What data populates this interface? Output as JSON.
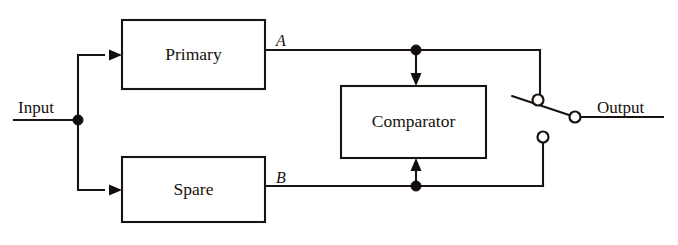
{
  "diagram": {
    "background_color": "#ffffff",
    "line_color": "#1a1410",
    "blocks": [
      {
        "id": "primary",
        "label": "Primary",
        "x": 122,
        "y": 20,
        "width": 143,
        "height": 69,
        "cx": 193.5,
        "cy": 54.5
      },
      {
        "id": "comparator",
        "label": "Comparator",
        "x": 341,
        "y": 86,
        "width": 145,
        "height": 72,
        "cx": 413.5,
        "cy": 122
      },
      {
        "id": "spare",
        "label": "Spare",
        "x": 122,
        "y": 157,
        "width": 143,
        "height": 65,
        "cx": 193.5,
        "cy": 189.5
      }
    ],
    "port_labels": [
      {
        "id": "port-a",
        "text": "A",
        "x": 281,
        "y": 46
      },
      {
        "id": "port-b",
        "text": "B",
        "x": 281,
        "y": 183
      }
    ],
    "io_labels": [
      {
        "id": "input",
        "text": "Input",
        "x": 18,
        "y": 113
      },
      {
        "id": "output",
        "text": "Output",
        "x": 597,
        "y": 113
      }
    ],
    "junctions": [
      {
        "id": "input-junction",
        "x": 78,
        "y": 120,
        "r": 5
      },
      {
        "id": "primary-output-junction",
        "x": 416,
        "y": 50,
        "r": 5
      },
      {
        "id": "spare-output-junction",
        "x": 416,
        "y": 186,
        "r": 5
      }
    ],
    "terminals": [
      {
        "id": "switch-pivot-terminal",
        "x": 538,
        "y": 100,
        "r": 5.5
      },
      {
        "id": "switch-output-contact",
        "x": 575,
        "y": 117,
        "r": 5.5
      },
      {
        "id": "switch-spare-contact",
        "x": 543,
        "y": 137,
        "r": 5.5
      }
    ],
    "switch": {
      "id": "transfer-switch",
      "state": "connected-to-primary",
      "blade_start_x": 512,
      "blade_start_y": 96,
      "blade_end_x": 575,
      "blade_end_y": 117
    },
    "wires": [
      {
        "id": "input-lead",
        "path": "M 14 120 L 78 120"
      },
      {
        "id": "input-to-primary-branch",
        "path": "M 78 120 L 78 55 L 104 55"
      },
      {
        "id": "input-to-spare-branch",
        "path": "M 78 120 L 78 190 L 104 190"
      },
      {
        "id": "primary-output-line",
        "path": "M 265 50 L 540 50"
      },
      {
        "id": "spare-output-line",
        "path": "M 265 186 L 543 186"
      },
      {
        "id": "primary-feedback-drop",
        "path": "M 540 50 L 540 96"
      },
      {
        "id": "spare-feedback-rise",
        "path": "M 543 186 L 543 143"
      },
      {
        "id": "comparator-top-lead",
        "path": "M 416 50 L 416 80"
      },
      {
        "id": "comparator-bottom-lead",
        "path": "M 416 186 L 416 163"
      },
      {
        "id": "output-lead",
        "path": "M 581 117 L 663 117"
      }
    ],
    "arrows": [
      {
        "id": "primary-input-arrow",
        "x": 122,
        "y": 55,
        "direction": "right"
      },
      {
        "id": "spare-input-arrow",
        "x": 122,
        "y": 190,
        "direction": "right"
      },
      {
        "id": "comparator-top-arrow",
        "x": 416,
        "y": 86,
        "direction": "down"
      },
      {
        "id": "comparator-bottom-arrow",
        "x": 416,
        "y": 158,
        "direction": "up"
      }
    ]
  }
}
